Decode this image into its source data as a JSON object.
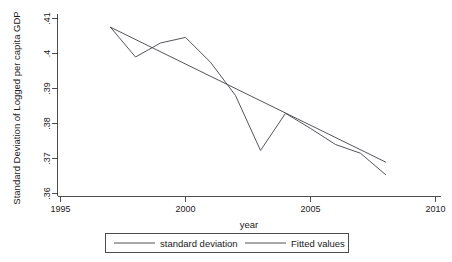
{
  "chart_data": {
    "type": "line",
    "title": "",
    "xlabel": "year",
    "ylabel": "Standard Deviation of Logged per capita GDP",
    "xlim": [
      1995,
      2010
    ],
    "ylim": [
      0.36,
      0.41
    ],
    "xticks": [
      "1995",
      "2000",
      "2005",
      "2010"
    ],
    "xtick_values": [
      1995,
      2000,
      2005,
      2010
    ],
    "yticks": [
      ".36",
      ".37",
      ".38",
      ".39",
      ".4",
      ".41"
    ],
    "ytick_values": [
      0.36,
      0.37,
      0.38,
      0.39,
      0.4,
      0.41
    ],
    "grid": false,
    "legend_position": "bottom-outside",
    "series": [
      {
        "name": "standard deviation",
        "color": "#4b4b52",
        "x": [
          1997,
          1998,
          1999,
          2000,
          2001,
          2002,
          2003,
          2004,
          2005,
          2006,
          2007,
          2008
        ],
        "y": [
          0.4075,
          0.399,
          0.403,
          0.4046,
          0.3975,
          0.388,
          0.3723,
          0.3829,
          0.3786,
          0.374,
          0.3715,
          0.3654
        ]
      },
      {
        "name": "Fitted values",
        "color": "#4b4b52",
        "x": [
          1997,
          2008
        ],
        "y": [
          0.4075,
          0.369
        ]
      }
    ]
  },
  "legend": {
    "entries": [
      {
        "label": "standard deviation"
      },
      {
        "label": "Fitted values"
      }
    ]
  },
  "axes": {
    "x_title": "year",
    "y_title": "Standard Deviation of Logged per capita GDP"
  },
  "colors": {
    "line": "#4b4b52",
    "axis": "#3a3a3a",
    "background": "#ffffff",
    "text": "#1a1a1a"
  }
}
